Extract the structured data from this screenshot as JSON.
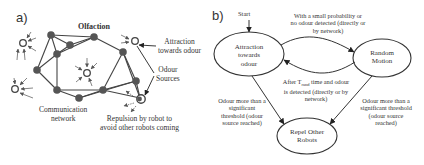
{
  "panel_a": {
    "tag": "a)",
    "title": "Olfaction",
    "labels": {
      "attraction_line1": "Attraction",
      "attraction_line2": "towards odour",
      "sources_line1": "Odour",
      "sources_line2": "Sources",
      "network_line1": "Communication",
      "network_line2": "network",
      "repulsion_line1": "Repulsion by robot to",
      "repulsion_line2": "avoid other robots coming"
    },
    "robots": [
      {
        "x": 51,
        "y": 35
      },
      {
        "x": 70,
        "y": 45
      },
      {
        "x": 94,
        "y": 37
      },
      {
        "x": 57,
        "y": 54
      },
      {
        "x": 37,
        "y": 70
      },
      {
        "x": 57,
        "y": 90
      },
      {
        "x": 79,
        "y": 98
      },
      {
        "x": 103,
        "y": 90
      },
      {
        "x": 123,
        "y": 52
      },
      {
        "x": 136,
        "y": 81
      }
    ],
    "odour_sources": [
      {
        "x": 23,
        "y": 43
      },
      {
        "x": 15,
        "y": 89
      },
      {
        "x": 87,
        "y": 73
      },
      {
        "x": 135,
        "y": 41
      },
      {
        "x": 141,
        "y": 99
      }
    ],
    "colors": {
      "robot": "#555555",
      "edge": "#444444",
      "source": "#444444"
    }
  },
  "panel_b": {
    "tag": "b)",
    "start_label": "Start",
    "states": {
      "attraction": [
        "Attraction",
        "towards",
        "odour"
      ],
      "random": [
        "Random",
        "Motion"
      ],
      "repel": [
        "Repel Other",
        "Robots"
      ]
    },
    "transitions": {
      "attraction_to_random": [
        "With a small probability or",
        "no odour detected (directly or",
        "by network)"
      ],
      "random_to_attraction": [
        "After T",
        "rand",
        " time and odour",
        "is detected (directly or by",
        "network)"
      ],
      "attraction_to_repel": [
        "Odour more than a",
        "significant",
        "threshold (odour",
        "source reached)"
      ],
      "random_to_repel": [
        "Odour more than a",
        "significant threshold",
        "(odour source",
        "reached)"
      ]
    }
  }
}
